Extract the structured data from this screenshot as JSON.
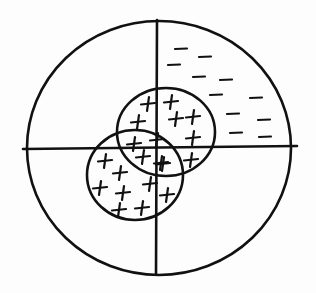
{
  "diagram": {
    "title": "",
    "stroke_color": "#111111",
    "background": "#fdfdfd",
    "outer_circle": {
      "cx": 159,
      "cy": 148,
      "rx": 132,
      "ry": 127
    },
    "axes": {
      "vertical": {
        "x1": 157,
        "y1": 20,
        "x2": 156,
        "y2": 274
      },
      "horizontal": {
        "x1": 23,
        "y1": 149,
        "x2": 297,
        "y2": 146
      }
    },
    "inner_circles": [
      {
        "name": "upper-right-circle",
        "cx": 166,
        "cy": 132,
        "rx": 49,
        "ry": 44,
        "sign": "+"
      },
      {
        "name": "lower-left-circle",
        "cx": 135,
        "cy": 175,
        "rx": 48,
        "ry": 45,
        "sign": "+"
      }
    ],
    "shaded_quadrant": {
      "quadrant": "upper-right",
      "sign": "-"
    },
    "minus_signs": [
      [
        181,
        49
      ],
      [
        205,
        57
      ],
      [
        174,
        65
      ],
      [
        199,
        77
      ],
      [
        226,
        80
      ],
      [
        216,
        95
      ],
      [
        256,
        98
      ],
      [
        233,
        114
      ],
      [
        264,
        120
      ],
      [
        236,
        133
      ],
      [
        265,
        137
      ]
    ],
    "plus_signs": [
      [
        148,
        104
      ],
      [
        171,
        102
      ],
      [
        138,
        122
      ],
      [
        176,
        119
      ],
      [
        193,
        117
      ],
      [
        193,
        138
      ],
      [
        163,
        164
      ],
      [
        191,
        160
      ],
      [
        134,
        144
      ],
      [
        157,
        140
      ],
      [
        105,
        161
      ],
      [
        143,
        157
      ],
      [
        161,
        163
      ],
      [
        120,
        173
      ],
      [
        100,
        188
      ],
      [
        123,
        193
      ],
      [
        150,
        184
      ],
      [
        167,
        195
      ],
      [
        119,
        210
      ],
      [
        142,
        208
      ]
    ]
  }
}
